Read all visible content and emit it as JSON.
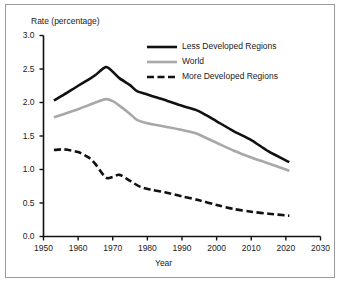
{
  "chart_data": {
    "type": "line",
    "title": "",
    "xlabel": "Year",
    "ylabel": "Rate (percentage)",
    "xlim": [
      1950,
      2030
    ],
    "ylim": [
      0.0,
      3.0
    ],
    "xticks": [
      1950,
      1960,
      1970,
      1980,
      1990,
      2000,
      2010,
      2020,
      2030
    ],
    "yticks": [
      "0.0",
      "0.5",
      "1.0",
      "1.5",
      "2.0",
      "2.5",
      "3.0"
    ],
    "grid": false,
    "legend_position": "upper-center",
    "series": [
      {
        "name": "Less Developed Regions",
        "style": "solid",
        "color": "#111111",
        "width": 2.6,
        "x": [
          1953,
          1956,
          1960,
          1963,
          1965,
          1968,
          1970,
          1972,
          1975,
          1977,
          1980,
          1983,
          1986,
          1990,
          1994,
          1997,
          2000,
          2005,
          2010,
          2015,
          2021
        ],
        "y": [
          2.03,
          2.12,
          2.25,
          2.34,
          2.41,
          2.53,
          2.46,
          2.36,
          2.26,
          2.17,
          2.12,
          2.07,
          2.02,
          1.95,
          1.89,
          1.81,
          1.72,
          1.57,
          1.44,
          1.27,
          1.11
        ]
      },
      {
        "name": "World",
        "style": "solid",
        "color": "#a8a8a8",
        "width": 2.6,
        "x": [
          1953,
          1956,
          1960,
          1963,
          1965,
          1968,
          1970,
          1972,
          1975,
          1977,
          1980,
          1983,
          1986,
          1990,
          1994,
          1997,
          2000,
          2005,
          2010,
          2015,
          2021
        ],
        "y": [
          1.78,
          1.83,
          1.9,
          1.96,
          2.0,
          2.05,
          2.02,
          1.95,
          1.83,
          1.74,
          1.69,
          1.66,
          1.63,
          1.59,
          1.54,
          1.47,
          1.4,
          1.28,
          1.18,
          1.09,
          0.98
        ]
      },
      {
        "name": "More Developed Regions",
        "style": "dashed",
        "color": "#111111",
        "width": 2.6,
        "x": [
          1953,
          1956,
          1960,
          1963,
          1965,
          1968,
          1970,
          1972,
          1975,
          1978,
          1981,
          1985,
          1990,
          1995,
          2000,
          2005,
          2010,
          2015,
          2021
        ],
        "y": [
          1.29,
          1.3,
          1.26,
          1.18,
          1.08,
          0.88,
          0.89,
          0.92,
          0.83,
          0.74,
          0.7,
          0.66,
          0.6,
          0.54,
          0.47,
          0.41,
          0.37,
          0.34,
          0.31
        ]
      }
    ],
    "legend_entries": [
      {
        "label": "Less Developed Regions",
        "style": "solid",
        "color": "#111111"
      },
      {
        "label": "World",
        "style": "solid",
        "color": "#a8a8a8"
      },
      {
        "label": "More Developed Regions",
        "style": "dashed",
        "color": "#111111"
      }
    ]
  },
  "axis": {
    "y_title": "Rate (percentage)",
    "x_title": "Year",
    "y_tick_labels": [
      "3.0",
      "2.5",
      "2.0",
      "1.5",
      "1.0",
      "0.5",
      "0.0"
    ],
    "x_tick_labels": [
      "1950",
      "1960",
      "1970",
      "1980",
      "1990",
      "2000",
      "2010",
      "2020",
      "2030"
    ]
  },
  "legend": {
    "item0": "Less Developed Regions",
    "item1": "World",
    "item2": "More Developed Regions"
  },
  "colors": {
    "axis": "#111111",
    "frame": "#9a9a9a",
    "less_developed": "#111111",
    "world": "#a8a8a8",
    "more_developed": "#111111",
    "background": "#ffffff"
  }
}
